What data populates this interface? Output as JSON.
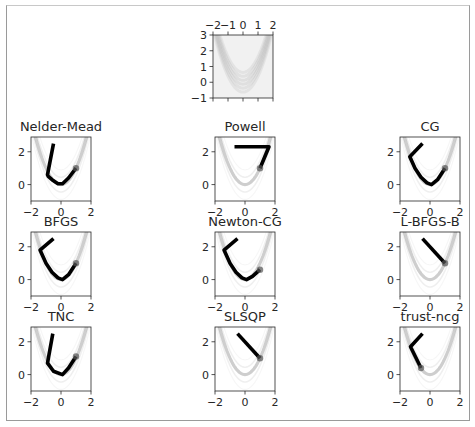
{
  "chart_data": [
    {
      "type": "heatmap",
      "name": "overview",
      "title": "",
      "description": "Rosenbrock function density image",
      "xlim": [
        -2,
        2
      ],
      "ylim": [
        -1,
        3
      ],
      "xticks": [
        -2,
        -1,
        0,
        1,
        2
      ],
      "xtick_labels": [
        "−2",
        "−1",
        "0",
        "1",
        "2"
      ],
      "xticks_position": "top",
      "yticks": [
        -1,
        0,
        1,
        2,
        3
      ],
      "ytick_labels": [
        "−1",
        "0",
        "1",
        "2",
        "3"
      ],
      "grid": false
    },
    {
      "type": "line",
      "title": "Nelder-Mead",
      "xlim": [
        -2,
        2
      ],
      "ylim": [
        -1,
        2.9
      ],
      "xticks": [
        -2,
        0,
        2
      ],
      "xtick_labels": [
        "−2",
        "0",
        "2"
      ],
      "yticks": [
        0,
        2
      ],
      "ytick_labels": [
        "0",
        "2"
      ],
      "path": {
        "x": [
          -0.5,
          -0.9,
          -0.85,
          -0.6,
          -0.2,
          0.1,
          0.5,
          1.0
        ],
        "y": [
          2.5,
          0.6,
          0.5,
          0.3,
          0.05,
          0.05,
          0.4,
          1.0
        ]
      }
    },
    {
      "type": "line",
      "title": "Powell",
      "xlim": [
        -2,
        2
      ],
      "ylim": [
        -1,
        2.9
      ],
      "xticks": [
        -2,
        0,
        2
      ],
      "xtick_labels": [
        "−2",
        "0",
        "2"
      ],
      "yticks": [
        0,
        2
      ],
      "ytick_labels": [
        "0",
        "2"
      ],
      "path": {
        "x": [
          -0.7,
          1.6,
          1.0
        ],
        "y": [
          2.3,
          2.3,
          1.0
        ]
      }
    },
    {
      "type": "line",
      "title": "CG",
      "xlim": [
        -2,
        2
      ],
      "ylim": [
        -1,
        2.9
      ],
      "xticks": [
        -2,
        0,
        2
      ],
      "xtick_labels": [
        "−2",
        "0",
        "2"
      ],
      "yticks": [
        0,
        2
      ],
      "ytick_labels": [
        "0",
        "2"
      ],
      "path": {
        "x": [
          -0.5,
          -1.35,
          -1.0,
          -0.6,
          -0.2,
          0.1,
          0.5,
          1.0
        ],
        "y": [
          2.5,
          1.7,
          1.0,
          0.45,
          0.1,
          0.0,
          0.3,
          1.0
        ]
      }
    },
    {
      "type": "line",
      "title": "BFGS",
      "xlim": [
        -2,
        2
      ],
      "ylim": [
        -1,
        2.9
      ],
      "xticks": [
        -2,
        0,
        2
      ],
      "xtick_labels": [
        "−2",
        "0",
        "2"
      ],
      "yticks": [
        0,
        2
      ],
      "ytick_labels": [
        "0",
        "2"
      ],
      "path": {
        "x": [
          -0.5,
          -1.4,
          -1.0,
          -0.6,
          -0.2,
          0.1,
          0.5,
          1.0
        ],
        "y": [
          2.5,
          1.8,
          1.0,
          0.45,
          0.1,
          0.0,
          0.3,
          1.0
        ]
      }
    },
    {
      "type": "line",
      "title": "Newton-CG",
      "xlim": [
        -2,
        2
      ],
      "ylim": [
        -1,
        2.9
      ],
      "xticks": [
        -2,
        0,
        2
      ],
      "xtick_labels": [
        "−2",
        "0",
        "2"
      ],
      "yticks": [
        0,
        2
      ],
      "ytick_labels": [
        "0",
        "2"
      ],
      "path": {
        "x": [
          -0.5,
          -1.4,
          -1.0,
          -0.6,
          -0.2,
          0.1,
          0.5,
          1.0
        ],
        "y": [
          2.5,
          1.8,
          1.0,
          0.45,
          0.1,
          0.0,
          0.2,
          0.6
        ]
      }
    },
    {
      "type": "line",
      "title": "L-BFGS-B",
      "xlim": [
        -2,
        2
      ],
      "ylim": [
        -1,
        2.9
      ],
      "xticks": [
        -2,
        0,
        2
      ],
      "xtick_labels": [
        "−2",
        "0",
        "2"
      ],
      "yticks": [
        0,
        2
      ],
      "ytick_labels": [
        "0",
        "2"
      ],
      "path": {
        "x": [
          -0.5,
          1.0
        ],
        "y": [
          2.5,
          1.0
        ]
      }
    },
    {
      "type": "line",
      "title": "TNC",
      "xlim": [
        -2,
        2
      ],
      "ylim": [
        -1,
        2.9
      ],
      "xticks": [
        -2,
        0,
        2
      ],
      "xtick_labels": [
        "−2",
        "0",
        "2"
      ],
      "yticks": [
        0,
        2
      ],
      "ytick_labels": [
        "0",
        "2"
      ],
      "path": {
        "x": [
          -0.55,
          -0.9,
          -0.5,
          0.1,
          0.5,
          1.0
        ],
        "y": [
          2.5,
          0.7,
          0.2,
          0.0,
          0.4,
          1.1
        ]
      }
    },
    {
      "type": "line",
      "title": "SLSQP",
      "xlim": [
        -2,
        2
      ],
      "ylim": [
        -1,
        2.9
      ],
      "xticks": [
        -2,
        0,
        2
      ],
      "xtick_labels": [
        "−2",
        "0",
        "2"
      ],
      "yticks": [
        0,
        2
      ],
      "ytick_labels": [
        "0",
        "2"
      ],
      "path": {
        "x": [
          -0.5,
          1.0
        ],
        "y": [
          2.5,
          1.0
        ]
      }
    },
    {
      "type": "line",
      "title": "trust-ncg",
      "xlim": [
        -2,
        2
      ],
      "ylim": [
        -1,
        2.9
      ],
      "xticks": [
        -2,
        0,
        2
      ],
      "xtick_labels": [
        "−2",
        "0",
        "2"
      ],
      "yticks": [
        0,
        2
      ],
      "ytick_labels": [
        "0",
        "2"
      ],
      "path": {
        "x": [
          -0.5,
          -1.3,
          -0.6
        ],
        "y": [
          2.5,
          1.7,
          0.4
        ]
      }
    }
  ]
}
